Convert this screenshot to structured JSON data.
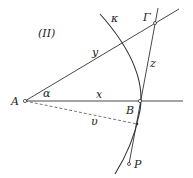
{
  "diagram": {
    "title": "(II)",
    "labels": {
      "A": "A",
      "B": "B",
      "Gamma": "Γ",
      "P": "P",
      "kappa": "κ",
      "alpha": "α",
      "x": "x",
      "y": "y",
      "z": "z",
      "v": "υ"
    },
    "colors": {
      "stroke": "#333333",
      "background": "#ffffff"
    }
  }
}
